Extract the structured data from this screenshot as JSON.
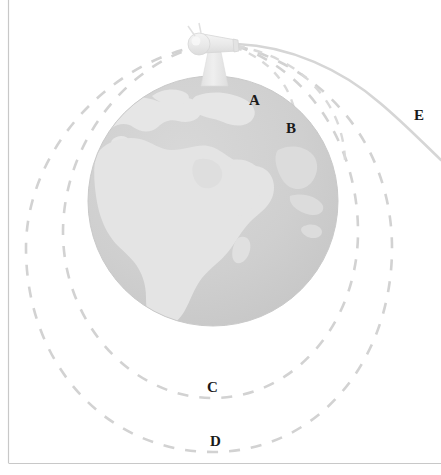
{
  "diagram": {
    "background_color": "#ffffff",
    "frame": {
      "border_color": "#c8c8c8",
      "left_line": true,
      "bottom_line": true
    },
    "globe": {
      "name": "earth",
      "center_x": 213,
      "center_y": 201,
      "radius": 125,
      "ocean_color": "#cfcfcf",
      "land_color": "#e4e4e4",
      "continents_shown": "Africa, Europe, Asia"
    },
    "cannon": {
      "name": "cannon",
      "body_color": "#ebebeb",
      "outline_color": "#d8d8d8",
      "tower_color": "#e6e6e6",
      "muzzle_x": 237,
      "muzzle_y": 44
    },
    "labels": [
      {
        "id": "A",
        "text": "A",
        "x": 249,
        "y": 105,
        "describes": "shortest trajectory, falls back to Earth"
      },
      {
        "id": "B",
        "text": "B",
        "x": 286,
        "y": 133,
        "describes": "longer trajectory, falls back to Earth"
      },
      {
        "id": "C",
        "text": "C",
        "x": 207,
        "y": 392,
        "describes": "closed elliptical orbit"
      },
      {
        "id": "D",
        "text": "D",
        "x": 210,
        "y": 446,
        "describes": "larger elliptical orbit"
      },
      {
        "id": "E",
        "text": "E",
        "x": 414,
        "y": 120,
        "describes": "escape trajectory leaving Earth"
      }
    ],
    "trajectories": [
      {
        "id": "A",
        "style": "dashed",
        "color": "#d9d9d9",
        "type": "suborbital"
      },
      {
        "id": "B",
        "style": "dashed",
        "color": "#d9d9d9",
        "type": "suborbital"
      },
      {
        "id": "C",
        "style": "dashed",
        "color": "#d2d2d2",
        "type": "elliptical-orbit"
      },
      {
        "id": "D",
        "style": "dashed",
        "color": "#d2d2d2",
        "type": "elliptical-orbit"
      },
      {
        "id": "E",
        "style": "solid",
        "color": "#d6d6d6",
        "type": "escape"
      }
    ]
  }
}
